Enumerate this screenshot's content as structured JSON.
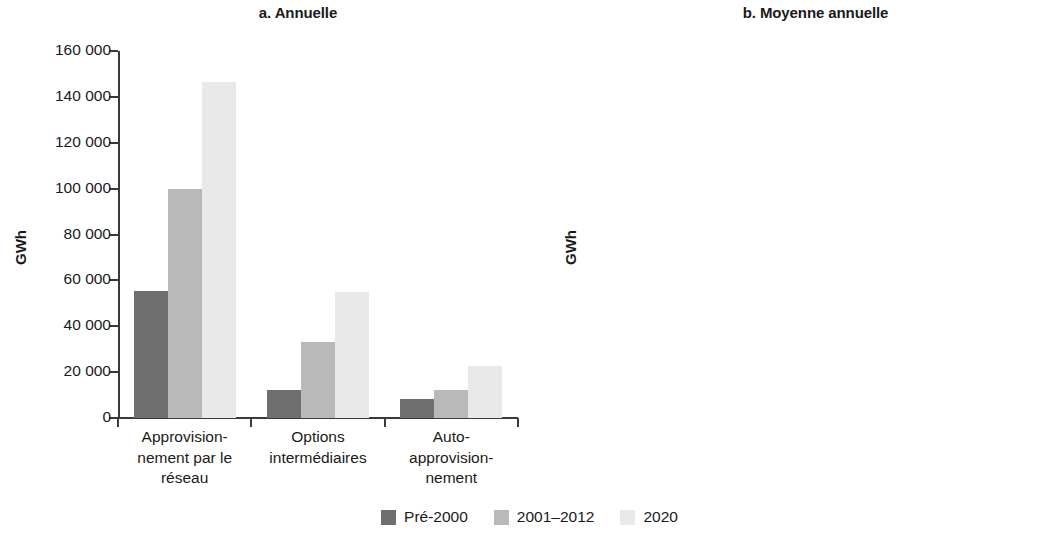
{
  "figure": {
    "ylabel": "GWh"
  },
  "legend": {
    "items": [
      {
        "label": "Pré-2000",
        "color": "#6e6e6e"
      },
      {
        "label": "2001–2012",
        "color": "#b9b9b9"
      },
      {
        "label": "2020",
        "color": "#e9e9e9"
      }
    ]
  },
  "chart_data": [
    {
      "type": "bar",
      "title": "a. Annuelle",
      "xlabel": "",
      "ylabel": "GWh",
      "ylim": [
        0,
        160000
      ],
      "yticks": [
        "0",
        "20 000",
        "40 000",
        "60 000",
        "80 000",
        "100 000",
        "120 000",
        "140 000",
        "160 000"
      ],
      "ytick_values": [
        0,
        20000,
        40000,
        60000,
        80000,
        100000,
        120000,
        140000,
        160000
      ],
      "grid": false,
      "legend_position": "bottom",
      "categories": [
        "Approvisionnement par le réseau",
        "Options intermédiaires",
        "Auto-approvisionnement"
      ],
      "category_lines": [
        [
          "Approvision-",
          "nement par le",
          "réseau"
        ],
        [
          "Options",
          "intermédiaires",
          ""
        ],
        [
          "Auto-",
          "approvision-",
          "nement"
        ]
      ],
      "series": [
        {
          "name": "Pré-2000",
          "color": "#6e6e6e",
          "values": [
            55500,
            12200,
            8500
          ]
        },
        {
          "name": "2001–2012",
          "color": "#b9b9b9",
          "values": [
            100000,
            33000,
            12000
          ]
        },
        {
          "name": "2020",
          "color": "#e9e9e9",
          "values": [
            146500,
            55000,
            22500
          ]
        }
      ]
    },
    {
      "type": "bar",
      "title": "b. Moyenne annuelle",
      "xlabel": "",
      "ylabel": "GWh",
      "ylim": [
        0,
        1200
      ],
      "yticks": [
        "0",
        "200",
        "400",
        "600",
        "800",
        "1 000",
        "1 200"
      ],
      "ytick_values": [
        0,
        200,
        400,
        600,
        800,
        1000,
        1200
      ],
      "grid": false,
      "legend_position": "bottom",
      "categories": [
        "Approvisionnement par le réseau",
        "Options intermédiaires",
        "Auto-approvisionnement"
      ],
      "category_lines": [
        [
          "Approvision-",
          "nement",
          "par le réseau"
        ],
        [
          "Options",
          "intermédiaires",
          ""
        ],
        [
          "Auto-",
          "approvision-",
          "nement"
        ]
      ],
      "series": [
        {
          "name": "Pré-2000",
          "color": "#6e6e6e",
          "values": [
            730,
            285,
            1080
          ]
        },
        {
          "name": "2001–2012",
          "color": "#b9b9b9",
          "values": [
            675,
            375,
            500
          ]
        },
        {
          "name": "2020",
          "color": "#e9e9e9",
          "values": [
            775,
            415,
            325
          ]
        }
      ]
    }
  ]
}
